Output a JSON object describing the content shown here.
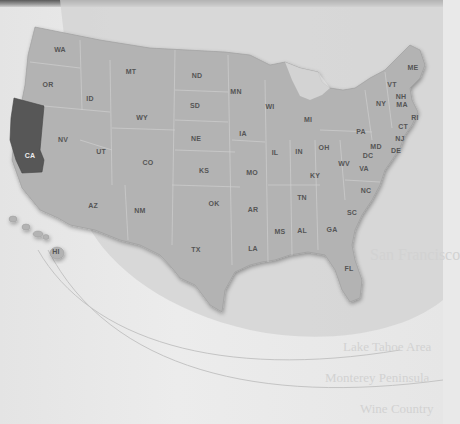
{
  "map": {
    "title": "United States map",
    "highlighted_state": "CA",
    "colors": {
      "land": "#b4b4b4",
      "highlight": "#5a5a5a",
      "background": "#e8e8e8",
      "arc": "#c8c8c8"
    },
    "states": [
      {
        "abbr": "WA",
        "x": 60,
        "y": 49
      },
      {
        "abbr": "OR",
        "x": 48,
        "y": 84
      },
      {
        "abbr": "CA",
        "x": 30,
        "y": 155
      },
      {
        "abbr": "ID",
        "x": 90,
        "y": 98
      },
      {
        "abbr": "NV",
        "x": 63,
        "y": 139
      },
      {
        "abbr": "MT",
        "x": 131,
        "y": 71
      },
      {
        "abbr": "WY",
        "x": 142,
        "y": 117
      },
      {
        "abbr": "UT",
        "x": 101,
        "y": 151
      },
      {
        "abbr": "CO",
        "x": 148,
        "y": 162
      },
      {
        "abbr": "AZ",
        "x": 93,
        "y": 205
      },
      {
        "abbr": "NM",
        "x": 140,
        "y": 210
      },
      {
        "abbr": "ND",
        "x": 197,
        "y": 75
      },
      {
        "abbr": "SD",
        "x": 195,
        "y": 105
      },
      {
        "abbr": "NE",
        "x": 196,
        "y": 138
      },
      {
        "abbr": "KS",
        "x": 204,
        "y": 170
      },
      {
        "abbr": "OK",
        "x": 214,
        "y": 203
      },
      {
        "abbr": "TX",
        "x": 196,
        "y": 249
      },
      {
        "abbr": "MN",
        "x": 236,
        "y": 91
      },
      {
        "abbr": "IA",
        "x": 243,
        "y": 133
      },
      {
        "abbr": "MO",
        "x": 252,
        "y": 172
      },
      {
        "abbr": "AR",
        "x": 253,
        "y": 209
      },
      {
        "abbr": "LA",
        "x": 253,
        "y": 248
      },
      {
        "abbr": "WI",
        "x": 270,
        "y": 106
      },
      {
        "abbr": "IL",
        "x": 275,
        "y": 152
      },
      {
        "abbr": "MS",
        "x": 280,
        "y": 231
      },
      {
        "abbr": "MI",
        "x": 308,
        "y": 119
      },
      {
        "abbr": "IN",
        "x": 299,
        "y": 151
      },
      {
        "abbr": "OH",
        "x": 324,
        "y": 147
      },
      {
        "abbr": "KY",
        "x": 315,
        "y": 175
      },
      {
        "abbr": "TN",
        "x": 302,
        "y": 197
      },
      {
        "abbr": "AL",
        "x": 302,
        "y": 230
      },
      {
        "abbr": "GA",
        "x": 332,
        "y": 229
      },
      {
        "abbr": "FL",
        "x": 349,
        "y": 268
      },
      {
        "abbr": "SC",
        "x": 352,
        "y": 212
      },
      {
        "abbr": "NC",
        "x": 366,
        "y": 190
      },
      {
        "abbr": "WV",
        "x": 344,
        "y": 163
      },
      {
        "abbr": "VA",
        "x": 364,
        "y": 168
      },
      {
        "abbr": "PA",
        "x": 361,
        "y": 131
      },
      {
        "abbr": "NY",
        "x": 381,
        "y": 103
      },
      {
        "abbr": "VT",
        "x": 392,
        "y": 84
      },
      {
        "abbr": "NH",
        "x": 401,
        "y": 96
      },
      {
        "abbr": "MA",
        "x": 402,
        "y": 104
      },
      {
        "abbr": "ME",
        "x": 413,
        "y": 67
      },
      {
        "abbr": "RI",
        "x": 415,
        "y": 117
      },
      {
        "abbr": "CT",
        "x": 403,
        "y": 126
      },
      {
        "abbr": "NJ",
        "x": 400,
        "y": 138
      },
      {
        "abbr": "MD",
        "x": 376,
        "y": 146
      },
      {
        "abbr": "DC",
        "x": 368,
        "y": 155
      },
      {
        "abbr": "DE",
        "x": 396,
        "y": 150
      },
      {
        "abbr": "HI",
        "x": 56,
        "y": 251
      }
    ]
  },
  "bleed_through_text": [
    {
      "text": "San Francisco",
      "x": 370,
      "y": 262,
      "size": 16
    },
    {
      "text": "Lake Tahoe Area",
      "x": 343,
      "y": 352,
      "size": 13
    },
    {
      "text": "Monterey Peninsula",
      "x": 325,
      "y": 383,
      "size": 13
    },
    {
      "text": "Wine Country",
      "x": 360,
      "y": 414,
      "size": 13
    }
  ]
}
